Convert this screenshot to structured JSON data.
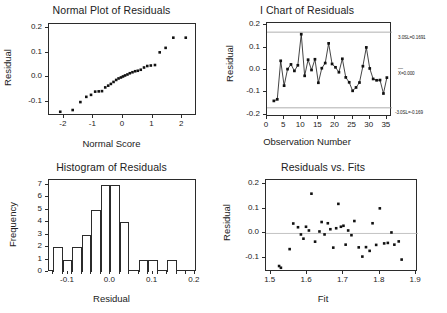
{
  "figure": {
    "panels": [
      "normal_plot",
      "i_chart",
      "histogram",
      "residuals_vs_fits"
    ],
    "background": "#ffffff",
    "ink": "#151515",
    "limit_line_color": "#9a9a9a"
  },
  "chart_data": [
    {
      "type": "scatter",
      "id": "normal_plot",
      "title": "Normal Plot of Residuals",
      "xlabel": "Normal Score",
      "ylabel": "Residual",
      "xlim": [
        -2.5,
        2.5
      ],
      "ylim": [
        -0.155,
        0.215
      ],
      "xticks": [
        -2,
        -1,
        0,
        1,
        2
      ],
      "xticklabels": [
        "-2",
        "-1",
        "0",
        "1",
        "2"
      ],
      "yticks": [
        -0.1,
        0.0,
        0.1,
        0.2
      ],
      "yticklabels": [
        "-0.1",
        "0.0",
        "0.1",
        "0.2"
      ],
      "grid": false,
      "legend": false,
      "x": [
        -2.12,
        -1.7,
        -1.44,
        -1.24,
        -1.08,
        -0.94,
        -0.82,
        -0.71,
        -0.6,
        -0.5,
        -0.41,
        -0.32,
        -0.23,
        -0.15,
        -0.07,
        0.0,
        0.07,
        0.15,
        0.23,
        0.32,
        0.41,
        0.5,
        0.6,
        0.71,
        0.82,
        0.94,
        1.08,
        1.24,
        1.44,
        1.7,
        2.12
      ],
      "y": [
        -0.138,
        -0.131,
        -0.099,
        -0.078,
        -0.07,
        -0.057,
        -0.056,
        -0.055,
        -0.04,
        -0.033,
        -0.026,
        -0.018,
        -0.01,
        -0.004,
        0.0,
        0.004,
        0.008,
        0.012,
        0.017,
        0.021,
        0.025,
        0.027,
        0.031,
        0.04,
        0.046,
        0.048,
        0.05,
        0.101,
        0.119,
        0.16,
        0.16
      ]
    },
    {
      "type": "line",
      "id": "i_chart",
      "title": "I Chart of Residuals",
      "xlabel": "Observation Number",
      "ylabel": "Residual",
      "xlim": [
        0,
        36.5
      ],
      "ylim": [
        -0.21,
        0.21
      ],
      "xticks": [
        0,
        5,
        10,
        15,
        20,
        25,
        30,
        35
      ],
      "xticklabels": [
        "0",
        "5",
        "10",
        "15",
        "20",
        "25",
        "30",
        "35"
      ],
      "yticks": [
        -0.2,
        -0.1,
        0.0,
        0.1,
        0.2
      ],
      "yticklabels": [
        "-0.2",
        "-0.1",
        "0.0",
        "0.1",
        "0.2"
      ],
      "grid": false,
      "legend": false,
      "markers": true,
      "x": [
        2,
        3,
        4,
        5,
        6,
        7,
        8,
        9,
        10,
        11,
        12,
        13,
        14,
        15,
        16,
        17,
        18,
        19,
        20,
        21,
        22,
        23,
        24,
        25,
        26,
        27,
        28,
        29,
        30,
        31,
        32,
        33,
        34,
        35
      ],
      "y": [
        -0.138,
        -0.131,
        0.041,
        -0.07,
        0.004,
        0.025,
        -0.004,
        0.021,
        0.16,
        -0.026,
        0.046,
        0.0,
        0.048,
        -0.057,
        0.008,
        0.031,
        0.119,
        0.027,
        0.012,
        -0.01,
        0.05,
        -0.033,
        -0.055,
        -0.093,
        -0.078,
        -0.056,
        0.017,
        0.101,
        0.007,
        -0.04,
        -0.046,
        -0.045,
        -0.105,
        -0.034
      ],
      "control_limits": {
        "ucl": 0.1691,
        "center": 0.0,
        "lcl": -0.169,
        "ucl_label": "3.0SL=0.1691",
        "center_label": "X=0.000",
        "lcl_label": "-3.0SL=-0.169"
      }
    },
    {
      "type": "bar",
      "id": "histogram",
      "title": "Histogram of Residuals",
      "xlabel": "Residual",
      "ylabel": "Frequency",
      "xlim": [
        -0.145,
        0.205
      ],
      "ylim": [
        0,
        7.4
      ],
      "xticks": [
        -0.1,
        0.0,
        0.1,
        0.2
      ],
      "xticklabels": [
        "-0.1",
        "0.0",
        "0.1",
        "0.2"
      ],
      "yticks": [
        0,
        1,
        2,
        3,
        4,
        5,
        6,
        7
      ],
      "yticklabels": [
        "0",
        "1",
        "2",
        "3",
        "4",
        "5",
        "6",
        "7"
      ],
      "grid": false,
      "legend": false,
      "bin_width": 0.0225,
      "bin_edges": [
        -0.135,
        -0.1125,
        -0.09,
        -0.0675,
        -0.045,
        -0.0225,
        0.0,
        0.0225,
        0.045,
        0.0675,
        0.09,
        0.1125,
        0.135,
        0.1575,
        0.18
      ],
      "values": [
        2,
        1,
        2,
        3,
        5,
        7,
        7,
        4,
        0,
        1,
        1,
        0,
        1
      ]
    },
    {
      "type": "scatter",
      "id": "residuals_vs_fits",
      "title": "Residuals vs. Fits",
      "xlabel": "Fit",
      "ylabel": "Residual",
      "xlim": [
        1.487,
        1.905
      ],
      "ylim": [
        -0.155,
        0.215
      ],
      "xticks": [
        1.5,
        1.6,
        1.7,
        1.8,
        1.9
      ],
      "xticklabels": [
        "1.5",
        "1.6",
        "1.7",
        "1.8",
        "1.9"
      ],
      "yticks": [
        -0.1,
        0.0,
        0.1,
        0.2
      ],
      "yticklabels": [
        "-0.1",
        "0.0",
        "0.1",
        "0.2"
      ],
      "grid": false,
      "legend": false,
      "reference_line_y": 0.0,
      "x": [
        1.523,
        1.528,
        1.552,
        1.562,
        1.575,
        1.583,
        1.59,
        1.597,
        1.605,
        1.612,
        1.622,
        1.634,
        1.64,
        1.648,
        1.657,
        1.664,
        1.672,
        1.68,
        1.686,
        1.693,
        1.7,
        1.706,
        1.713,
        1.722,
        1.73,
        1.742,
        1.752,
        1.762,
        1.772,
        1.78,
        1.79,
        1.8,
        1.812,
        1.822,
        1.832,
        1.84,
        1.852,
        1.86
      ],
      "y": [
        -0.131,
        -0.138,
        -0.063,
        0.04,
        0.025,
        -0.004,
        -0.021,
        0.027,
        0.012,
        0.16,
        -0.033,
        0.008,
        0.046,
        -0.004,
        0.041,
        0.017,
        -0.057,
        0.021,
        0.119,
        0.027,
        0.031,
        -0.045,
        0.012,
        -0.007,
        0.05,
        -0.056,
        -0.093,
        -0.055,
        -0.07,
        0.041,
        -0.046,
        0.101,
        -0.04,
        -0.038,
        0.004,
        -0.045,
        -0.032,
        -0.105
      ]
    }
  ]
}
